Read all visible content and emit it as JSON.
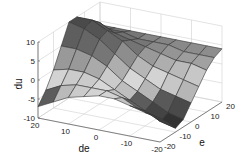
{
  "chart_data": {
    "type": "surface3d",
    "title": "",
    "xlabel": "de",
    "ylabel": "e",
    "zlabel": "du",
    "x_ticks": [
      "20",
      "10",
      "0",
      "-10",
      "-20"
    ],
    "y_ticks": [
      "-20",
      "-10",
      "0",
      "10",
      "20"
    ],
    "z_ticks": [
      "10",
      "5",
      "0",
      "-5",
      "-10"
    ],
    "xlim": [
      -20,
      20
    ],
    "ylim": [
      -20,
      20
    ],
    "zlim": [
      -10,
      10
    ],
    "grid": true,
    "de": [
      -20,
      -15,
      -10,
      -5,
      0,
      5,
      10,
      15,
      20
    ],
    "e": [
      -20,
      -15,
      -10,
      -5,
      0,
      5,
      10,
      15,
      20
    ],
    "du": [
      [
        -4,
        -6,
        -9,
        -8,
        -5,
        -2,
        1,
        3,
        4
      ],
      [
        -3,
        -5,
        -8,
        -7,
        -4,
        -1,
        2,
        3,
        4
      ],
      [
        -2,
        -4,
        -6,
        -5,
        -3,
        0,
        2,
        3,
        4
      ],
      [
        -1,
        -2,
        -4,
        -3,
        -1,
        1,
        3,
        4,
        4
      ],
      [
        -1,
        -1,
        -2,
        -1,
        1,
        3,
        4,
        4,
        4
      ],
      [
        -2,
        -1,
        0,
        2,
        4,
        6,
        5,
        4,
        4
      ],
      [
        -3,
        -1,
        1,
        4,
        7,
        8,
        6,
        5,
        4
      ],
      [
        -5,
        -2,
        1,
        5,
        9,
        10,
        8,
        5,
        4
      ],
      [
        -7,
        -4,
        0,
        5,
        10,
        10,
        8,
        5,
        4
      ]
    ]
  }
}
